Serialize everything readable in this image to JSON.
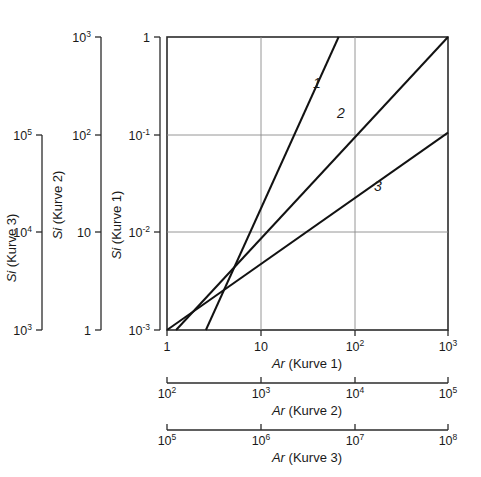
{
  "chart_data": {
    "type": "line",
    "title": "",
    "log_x": true,
    "log_y": true,
    "grid": true,
    "legend_position": "inline-labels",
    "axes": {
      "x_axes": [
        {
          "id": "x1",
          "label_italic": "Ar",
          "label_rest": "(Kurve 1)",
          "label": "Ar (Kurve 1)",
          "ticks": [
            {
              "value": 1,
              "text": "1",
              "mantissa": "1",
              "exponent": ""
            },
            {
              "value": 10,
              "text": "10",
              "mantissa": "10",
              "exponent": ""
            },
            {
              "value": 100,
              "text": "10^2",
              "mantissa": "10",
              "exponent": "2"
            },
            {
              "value": 1000,
              "text": "10^3",
              "mantissa": "10",
              "exponent": "3"
            }
          ],
          "range": [
            1,
            1000
          ]
        },
        {
          "id": "x2",
          "label_italic": "Ar",
          "label_rest": "(Kurve 2)",
          "label": "Ar (Kurve 2)",
          "ticks": [
            {
              "value": 100,
              "text": "10^2",
              "mantissa": "10",
              "exponent": "2"
            },
            {
              "value": 1000,
              "text": "10^3",
              "mantissa": "10",
              "exponent": "3"
            },
            {
              "value": 10000,
              "text": "10^4",
              "mantissa": "10",
              "exponent": "4"
            },
            {
              "value": 100000,
              "text": "10^5",
              "mantissa": "10",
              "exponent": "5"
            }
          ],
          "range": [
            100,
            100000
          ]
        },
        {
          "id": "x3",
          "label_italic": "Ar",
          "label_rest": "(Kurve 3)",
          "label": "Ar (Kurve 3)",
          "ticks": [
            {
              "value": 100000,
              "text": "10^5",
              "mantissa": "10",
              "exponent": "5"
            },
            {
              "value": 1000000,
              "text": "10^6",
              "mantissa": "10",
              "exponent": "6"
            },
            {
              "value": 10000000,
              "text": "10^7",
              "mantissa": "10",
              "exponent": "7"
            },
            {
              "value": 100000000,
              "text": "10^8",
              "mantissa": "10",
              "exponent": "8"
            }
          ],
          "range": [
            100000,
            100000000
          ]
        }
      ],
      "y_axes": [
        {
          "id": "y1",
          "label_italic": "Si",
          "label_rest": "(Kurve 1)",
          "label": "Si (Kurve 1)",
          "ticks": [
            {
              "value": 0.001,
              "text": "10^-3",
              "mantissa": "10",
              "exponent": "-3"
            },
            {
              "value": 0.01,
              "text": "10^-2",
              "mantissa": "10",
              "exponent": "-2"
            },
            {
              "value": 0.1,
              "text": "10^-1",
              "mantissa": "10",
              "exponent": "-1"
            },
            {
              "value": 1,
              "text": "1",
              "mantissa": "1",
              "exponent": ""
            }
          ],
          "range": [
            0.001,
            1
          ]
        },
        {
          "id": "y2",
          "label_italic": "Si",
          "label_rest": "(Kurve 2)",
          "label": "Si (Kurve 2)",
          "ticks": [
            {
              "value": 1,
              "text": "1",
              "mantissa": "1",
              "exponent": ""
            },
            {
              "value": 10,
              "text": "10",
              "mantissa": "10",
              "exponent": ""
            },
            {
              "value": 100,
              "text": "10^2",
              "mantissa": "10",
              "exponent": "2"
            },
            {
              "value": 1000,
              "text": "10^3",
              "mantissa": "10",
              "exponent": "3"
            }
          ],
          "range": [
            1,
            1000
          ]
        },
        {
          "id": "y3",
          "label_italic": "Si",
          "label_rest": "(Kurve 3)",
          "label": "Si (Kurve 3)",
          "ticks": [
            {
              "value": 1000,
              "text": "10^3",
              "mantissa": "10",
              "exponent": "3"
            },
            {
              "value": 10000,
              "text": "10^4",
              "mantissa": "10",
              "exponent": "4"
            },
            {
              "value": 100000,
              "text": "10^5",
              "mantissa": "10",
              "exponent": "5"
            }
          ],
          "range": [
            1000,
            100000
          ]
        }
      ]
    },
    "series": [
      {
        "name": "1",
        "label": "1",
        "x_axis": "x1",
        "y_axis": "y1",
        "points": [
          {
            "x": 2.6,
            "y": 0.001
          },
          {
            "x": 9.0,
            "y": 0.0145
          },
          {
            "x": 33.0,
            "y": 0.1
          },
          {
            "x": 68.0,
            "y": 1.0
          }
        ]
      },
      {
        "name": "2",
        "label": "2",
        "x_axis": "x2",
        "y_axis": "y2",
        "points": [
          {
            "x": 1.25,
            "y": 0.001
          },
          {
            "x": 9.0,
            "y": 0.0145
          },
          {
            "x": 100.0,
            "y": 0.125
          },
          {
            "x": 1000.0,
            "y": 1.0
          }
        ]
      },
      {
        "name": "3",
        "label": "3",
        "x_axis": "x3",
        "y_axis": "y3",
        "points": [
          {
            "x": 1.0,
            "y": 0.001
          },
          {
            "x": 10.0,
            "y": 0.0047
          },
          {
            "x": 100.0,
            "y": 0.0225
          },
          {
            "x": 1000.0,
            "y": 0.105
          }
        ]
      }
    ]
  }
}
